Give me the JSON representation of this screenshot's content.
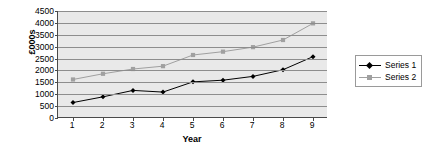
{
  "chart_data": {
    "type": "line",
    "title": "",
    "xlabel": "Year",
    "ylabel": "£000s",
    "categories": [
      "1",
      "2",
      "3",
      "4",
      "5",
      "6",
      "7",
      "8",
      "9"
    ],
    "x": [
      1,
      2,
      3,
      4,
      5,
      6,
      7,
      8,
      9
    ],
    "ylim": [
      0,
      4500
    ],
    "yticks": [
      "4500",
      "4000",
      "3500",
      "3000",
      "2500",
      "2000",
      "1500",
      "1000",
      "500",
      "0"
    ],
    "ytick_values": [
      4500,
      4000,
      3500,
      3000,
      2500,
      2000,
      1500,
      1000,
      500,
      0
    ],
    "grid": true,
    "legend_position": "right",
    "series": [
      {
        "name": "Series 1",
        "color": "#000000",
        "marker": "diamond",
        "values": [
          650,
          890,
          1160,
          1090,
          1520,
          1590,
          1750,
          2030,
          2580
        ]
      },
      {
        "name": "Series 2",
        "color": "#a0a0a0",
        "marker": "square",
        "values": [
          1620,
          1860,
          2060,
          2180,
          2650,
          2790,
          2980,
          3280,
          3980
        ]
      }
    ]
  },
  "colors": {
    "plot_background": "#e9e9e9",
    "gridline": "#8d8d8d",
    "axis": "#4a4a4a",
    "series1": "#000000",
    "series2": "#a0a0a0",
    "legend_border": "#9a9a9a",
    "page_background": "#ffffff"
  }
}
